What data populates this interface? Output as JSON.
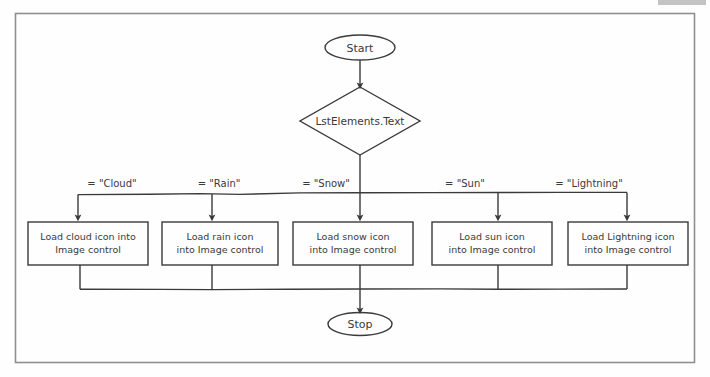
{
  "document": {
    "type": "flowchart",
    "title": "Weather icon selection flowchart",
    "paper_color": "#fefefe",
    "ink_color": "#3a3a3a",
    "frame_color": "#8f8f8f"
  },
  "nodes": {
    "start": {
      "label": "Start",
      "shape": "terminator"
    },
    "decision": {
      "label": "LstElements.Text",
      "shape": "decision"
    },
    "stop": {
      "label": "Stop",
      "shape": "terminator"
    }
  },
  "branches": [
    {
      "condition": "= \"Cloud\"",
      "process_line1": "Load cloud icon into",
      "process_line2": "Image control"
    },
    {
      "condition": "= \"Rain\"",
      "process_line1": "Load rain icon",
      "process_line2": "into Image control"
    },
    {
      "condition": "= \"Snow\"",
      "process_line1": "Load snow icon",
      "process_line2": "into Image control"
    },
    {
      "condition": "= \"Sun\"",
      "process_line1": "Load sun icon",
      "process_line2": "into Image control"
    },
    {
      "condition": "= \"Lightning\"",
      "process_line1": "Load Lightning icon",
      "process_line2": "into Image control"
    }
  ]
}
